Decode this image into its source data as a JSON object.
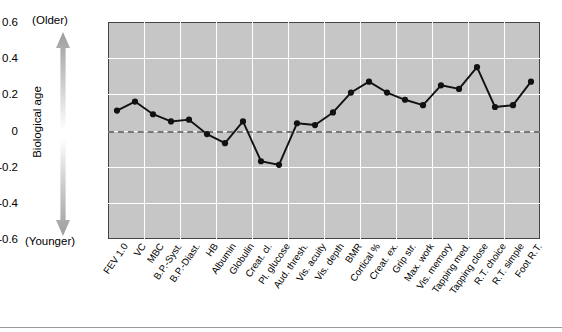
{
  "axis_annotation": {
    "top_label": "(Older)",
    "bottom_label": "(Younger)",
    "vertical_label": "Biological age"
  },
  "chart_data": {
    "type": "line",
    "title": "",
    "subtitle": "",
    "xlabel": "",
    "ylabel": "Biological age",
    "ylim": [
      -0.6,
      0.6
    ],
    "yticks": [
      "0.6",
      "0.4",
      "0.2",
      "0",
      "-0.2",
      "-0.4",
      "-0.6"
    ],
    "ytick_values": [
      0.6,
      0.4,
      0.2,
      0,
      -0.2,
      -0.4,
      -0.6
    ],
    "grid": true,
    "legend": "none",
    "reference_line": 0,
    "marker": "filled-circle",
    "line_color": "#111111",
    "marker_color": "#111111",
    "plot_background": "#c6c6c6",
    "gridline_color": "#ffffff",
    "categories": [
      "FEV 1.0",
      "VC",
      "MBC",
      "B.P.-Syst.",
      "B.P.-Diast.",
      "HB",
      "Albumin",
      "Globulin",
      "Creat. cl.",
      "Pl. glucose",
      "Aud. thresh.",
      "Vis. acuity",
      "Vis. depth",
      "BMR",
      "Cortical %",
      "Creat. ex.",
      "Grip str.",
      "Max. work",
      "Vis. memory",
      "Tapping med.",
      "Tapping close",
      "R.T. choice",
      "R.T. simple",
      "Foot R.T."
    ],
    "values": [
      0.11,
      0.16,
      0.09,
      0.05,
      0.06,
      -0.02,
      -0.07,
      0.05,
      -0.17,
      -0.19,
      0.04,
      0.03,
      0.1,
      0.21,
      0.27,
      0.21,
      0.17,
      0.14,
      0.25,
      0.23,
      0.35,
      0.13,
      0.14,
      0.27
    ]
  }
}
